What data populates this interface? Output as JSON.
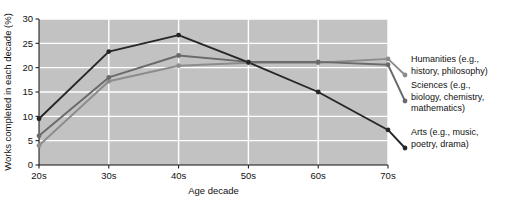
{
  "chart_data": {
    "type": "line",
    "title": "",
    "xlabel": "Age decade",
    "ylabel": "Works completed in each decade (%)",
    "categories": [
      "20s",
      "30s",
      "40s",
      "50s",
      "60s",
      "70s"
    ],
    "x_tick_labels": [
      "20s",
      "30s",
      "40s",
      "50s",
      "60s",
      "70s"
    ],
    "y_tick_labels": [
      "0",
      "5",
      "10",
      "15",
      "20",
      "25",
      "30"
    ],
    "y_ticks": [
      0,
      5,
      10,
      15,
      20,
      25,
      30
    ],
    "ylim": [
      0,
      30
    ],
    "grid": "horizontal-and-vertical-white",
    "legend_position": "right-inline-labels",
    "series": [
      {
        "name": "Humanities (e.g., history, philosophy)",
        "label_line1": "Humanities (e.g.,",
        "label_line2": "history, philosophy)",
        "color": "#8c8c8c",
        "values": [
          4.0,
          17.2,
          20.4,
          21.0,
          21.0,
          21.8
        ]
      },
      {
        "name": "Sciences (e.g., biology, chemistry, mathematics)",
        "label_line1": "Sciences (e.g.,",
        "label_line2": "biology, chemistry,",
        "label_line3": "mathematics)",
        "color": "#6a6a6a",
        "values": [
          6.0,
          18.0,
          22.5,
          21.2,
          21.2,
          20.6
        ]
      },
      {
        "name": "Arts (e.g., music, poetry, drama)",
        "label_line1": "Arts (e.g., music,",
        "label_line2": "poetry, drama)",
        "color": "#262626",
        "values": [
          9.5,
          23.3,
          26.7,
          21.1,
          15.0,
          7.2
        ]
      }
    ]
  },
  "colors": {
    "plot_background": "#c2c2c2",
    "gridline": "#ffffff",
    "figure_background": "#ffffff",
    "text": "#111111"
  }
}
